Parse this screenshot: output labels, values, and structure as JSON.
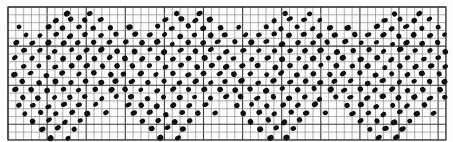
{
  "figure": {
    "kind": "scanned-grid-dot-pattern",
    "title": "",
    "caption": "",
    "width": 453,
    "height": 142,
    "background_color": "#ffffff",
    "paper_color": "#fdfdfd"
  },
  "grid": {
    "origin_x": 8,
    "origin_y": 7,
    "cell_width": 7.82,
    "cell_height": 7.82,
    "columns": 56,
    "rows": 17,
    "major_every": 5,
    "minor_color": "#8c8c8c",
    "major_color": "#3a3a3a",
    "frame_color": "#2e2e2e",
    "show_grid": true
  },
  "dots": {
    "color": "#101010",
    "radius_x": 2.9,
    "radius_y": 2.45,
    "rotation_deg": -28,
    "count_per_motif": 92
  },
  "chart_data": {
    "type": "scatter",
    "title": "",
    "xlabel": "",
    "ylabel": "",
    "xlim": [
      0,
      56
    ],
    "ylim": [
      0,
      17
    ],
    "grid": true,
    "legend": null,
    "motif_period_cells": 14,
    "motif_repeats": 4,
    "motif_name": "pinwheel-star",
    "motif_points": [
      [
        7.0,
        0.3
      ],
      [
        10.0,
        0.3
      ],
      [
        5.6,
        1.2
      ],
      [
        7.6,
        1.0
      ],
      [
        9.4,
        1.2
      ],
      [
        11.3,
        1.1
      ],
      [
        1.0,
        2.1
      ],
      [
        4.6,
        2.0
      ],
      [
        6.5,
        2.2
      ],
      [
        8.5,
        2.0
      ],
      [
        10.4,
        2.2
      ],
      [
        12.6,
        2.1
      ],
      [
        1.8,
        3.0
      ],
      [
        3.6,
        3.1
      ],
      [
        5.6,
        3.0
      ],
      [
        7.5,
        3.2
      ],
      [
        9.4,
        3.0
      ],
      [
        11.4,
        3.1
      ],
      [
        13.3,
        3.0
      ],
      [
        0.6,
        4.0
      ],
      [
        2.7,
        4.1
      ],
      [
        4.6,
        4.0
      ],
      [
        6.6,
        4.2
      ],
      [
        8.5,
        4.0
      ],
      [
        10.5,
        4.1
      ],
      [
        12.4,
        4.0
      ],
      [
        1.6,
        5.1
      ],
      [
        3.6,
        5.0
      ],
      [
        5.5,
        5.2
      ],
      [
        7.6,
        5.0
      ],
      [
        9.5,
        5.1
      ],
      [
        11.5,
        5.0
      ],
      [
        13.5,
        5.2
      ],
      [
        0.4,
        6.0
      ],
      [
        2.6,
        6.1
      ],
      [
        4.7,
        6.0
      ],
      [
        6.6,
        6.2
      ],
      [
        8.6,
        6.0
      ],
      [
        10.6,
        6.1
      ],
      [
        12.5,
        6.0
      ],
      [
        1.5,
        7.1
      ],
      [
        3.5,
        7.0
      ],
      [
        5.6,
        7.2
      ],
      [
        7.6,
        7.0
      ],
      [
        9.6,
        7.1
      ],
      [
        11.6,
        7.0
      ],
      [
        13.4,
        7.1
      ],
      [
        0.3,
        8.1
      ],
      [
        2.4,
        8.0
      ],
      [
        4.5,
        8.2
      ],
      [
        6.5,
        8.0
      ],
      [
        8.5,
        8.1
      ],
      [
        10.5,
        8.0
      ],
      [
        12.6,
        8.1
      ],
      [
        1.4,
        9.0
      ],
      [
        3.4,
        9.2
      ],
      [
        5.5,
        9.0
      ],
      [
        7.5,
        9.1
      ],
      [
        9.5,
        9.0
      ],
      [
        11.5,
        9.1
      ],
      [
        13.3,
        9.0
      ],
      [
        0.5,
        10.1
      ],
      [
        2.5,
        10.0
      ],
      [
        4.5,
        10.2
      ],
      [
        6.6,
        10.0
      ],
      [
        8.6,
        10.1
      ],
      [
        10.6,
        10.0
      ],
      [
        12.7,
        10.1
      ],
      [
        1.3,
        11.0
      ],
      [
        3.4,
        11.2
      ],
      [
        5.4,
        11.0
      ],
      [
        7.4,
        11.1
      ],
      [
        9.4,
        11.0
      ],
      [
        11.4,
        11.2
      ],
      [
        13.4,
        11.0
      ],
      [
        0.8,
        12.1
      ],
      [
        2.6,
        12.0
      ],
      [
        4.6,
        12.2
      ],
      [
        6.6,
        12.0
      ],
      [
        8.6,
        12.1
      ],
      [
        10.8,
        12.0
      ],
      [
        1.6,
        13.1
      ],
      [
        3.6,
        13.0
      ],
      [
        5.6,
        13.2
      ],
      [
        7.7,
        13.0
      ],
      [
        9.7,
        13.1
      ],
      [
        12.0,
        13.0
      ],
      [
        2.6,
        14.1
      ],
      [
        4.7,
        14.0
      ],
      [
        6.8,
        14.2
      ],
      [
        8.8,
        14.0
      ],
      [
        3.8,
        15.1
      ],
      [
        5.8,
        15.0
      ],
      [
        7.9,
        15.1
      ],
      [
        5.0,
        16.2
      ],
      [
        7.2,
        16.2
      ]
    ]
  }
}
